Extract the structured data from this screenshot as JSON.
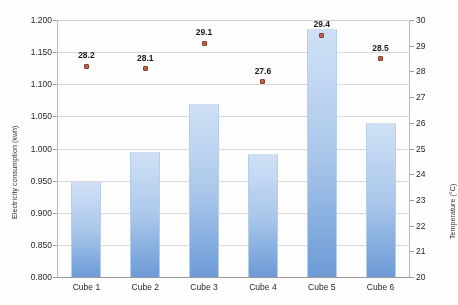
{
  "chart_data": {
    "type": "bar",
    "title": "",
    "subtitle": "",
    "categories": [
      "Cube 1",
      "Cube 2",
      "Cube 3",
      "Cube 4",
      "Cube 5",
      "Cube 6"
    ],
    "xlabel": "",
    "grid": true,
    "legend": "none",
    "series": [
      {
        "name": "Electricity consumption (kwh)",
        "type": "bar",
        "axis": "left",
        "values": [
          0.948,
          0.994,
          1.069,
          0.991,
          1.186,
          1.04
        ],
        "color": "#a9c6ea"
      },
      {
        "name": "Temperature (°C)",
        "type": "scatter",
        "axis": "right",
        "values": [
          28.2,
          28.1,
          29.1,
          27.6,
          29.4,
          28.5
        ],
        "labels": [
          "28.2",
          "28.1",
          "29.1",
          "27.6",
          "29.4",
          "28.5"
        ],
        "color": "#c0604a"
      }
    ],
    "axes": {
      "left": {
        "label": "Electricity consumption (kwh)",
        "min": 0.8,
        "max": 1.2,
        "step": 0.05,
        "ticks": [
          "0.800",
          "0.850",
          "0.900",
          "0.950",
          "1.000",
          "1.050",
          "1.100",
          "1.150",
          "1.200"
        ],
        "tick_values": [
          0.8,
          0.85,
          0.9,
          0.95,
          1.0,
          1.05,
          1.1,
          1.15,
          1.2
        ]
      },
      "right": {
        "label": "Temperature (°C)",
        "min": 20,
        "max": 30,
        "step": 1,
        "ticks": [
          "20",
          "21",
          "22",
          "23",
          "24",
          "25",
          "26",
          "27",
          "28",
          "29",
          "30"
        ],
        "tick_values": [
          20,
          21,
          22,
          23,
          24,
          25,
          26,
          27,
          28,
          29,
          30
        ]
      }
    }
  }
}
